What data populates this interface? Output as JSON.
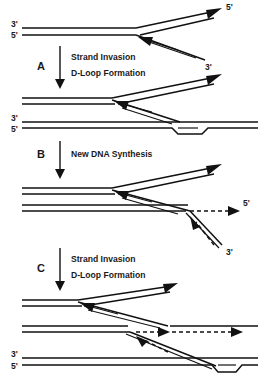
{
  "figure": {
    "type": "diagram",
    "width": 266,
    "height": 388,
    "background_color": "#ffffff",
    "line_color": "#111111"
  },
  "steps": [
    {
      "letter": "A",
      "lines": [
        "Strand Invasion",
        "D-Loop Formation"
      ],
      "arrow_direction": "down"
    },
    {
      "letter": "B",
      "lines": [
        "New DNA Synthesis"
      ],
      "arrow_direction": "down"
    },
    {
      "letter": "C",
      "lines": [
        "Strand Invasion",
        "D-Loop Formation"
      ],
      "arrow_direction": "down"
    }
  ],
  "panels": [
    {
      "name": "panel-initial",
      "end_labels": [
        {
          "text": "3'",
          "position": "left-top"
        },
        {
          "text": "5'",
          "position": "left-bottom"
        },
        {
          "text": "5'",
          "position": "right-upper-branch"
        },
        {
          "text": "3'",
          "position": "right-lower-branch"
        }
      ]
    },
    {
      "name": "panel-after-a",
      "end_labels": [
        {
          "text": "3'",
          "position": "left-top-duplex2"
        },
        {
          "text": "5'",
          "position": "left-bottom-duplex2"
        }
      ]
    },
    {
      "name": "panel-after-b",
      "end_labels": [
        {
          "text": "5'",
          "position": "right-dashed-extension"
        },
        {
          "text": "3'",
          "position": "right-invading-strand"
        }
      ]
    },
    {
      "name": "panel-after-c",
      "end_labels": [
        {
          "text": "3'",
          "position": "left-top-duplex3"
        },
        {
          "text": "5'",
          "position": "left-bottom-duplex3"
        }
      ]
    }
  ],
  "legend_notes": {
    "solid_line": "existing DNA strand",
    "dashed_line": "newly synthesized DNA",
    "arrowhead": "3' growing end direction",
    "bubble": "D-loop displacement"
  }
}
